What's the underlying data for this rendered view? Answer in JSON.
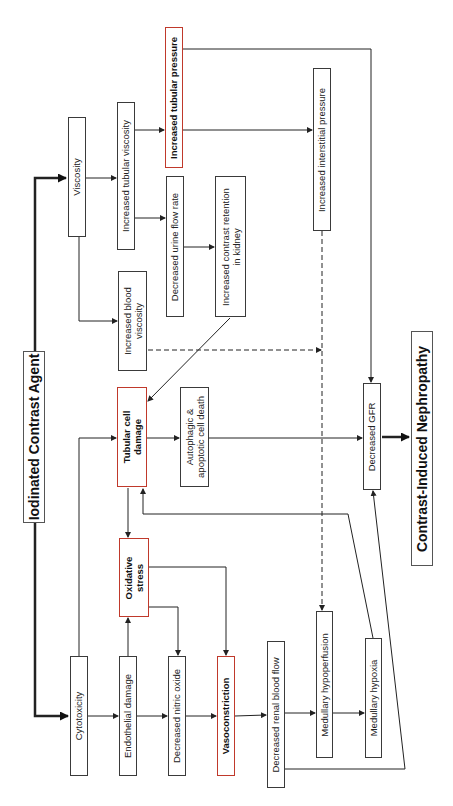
{
  "diagram": {
    "title": "Iodinated Contrast Agent",
    "outcome": "Contrast-Induced Nephropathy",
    "orientation": "rotated-90-ccw",
    "highlight_color": "#c0392b",
    "nodes": {
      "iodinated_contrast_agent": "Iodinated Contrast Agent",
      "viscosity": "Viscosity",
      "increased_tubular_viscosity": "Increased tubular viscosity",
      "increased_tubular_pressure": "Increased tubular pressure",
      "decreased_urine_flow_rate": "Decreased urine flow rate",
      "increased_contrast_retention_l1": "Increased contrast retention",
      "increased_contrast_retention_l2": "in kidney",
      "increased_interstitial_pressure": "Increased interstitial pressure",
      "increased_blood_viscosity_l1": "Increased blood",
      "increased_blood_viscosity_l2": "viscosity",
      "tubular_cell_damage_l1": "Tubular cell",
      "tubular_cell_damage_l2": "damage",
      "autophagic_l1": "Autophagic &",
      "autophagic_l2": "apoptotic cell death",
      "decreased_gfr": "Decreased GFR",
      "contrast_induced_nephropathy": "Contrast-Induced Nephropathy",
      "cytotoxicity": "Cytotoxicity",
      "endothelial_damage": "Endothelial damage",
      "oxidative_stress_l1": "Oxidative",
      "oxidative_stress_l2": "stress",
      "decreased_nitric_oxide": "Decreased nitric oxide",
      "vasoconstriction": "Vasoconstriction",
      "decreased_renal_blood_flow": "Decreased renal blood flow",
      "medullary_hypoperfusion": "Medullary hypoperfusion",
      "medullary_hypoxia": "Medullary hypoxia"
    },
    "edges": [
      {
        "from": "Iodinated Contrast Agent",
        "to": "Viscosity",
        "style": "thick"
      },
      {
        "from": "Iodinated Contrast Agent",
        "to": "Cytotoxicity",
        "style": "thick"
      },
      {
        "from": "Viscosity",
        "to": "Increased tubular viscosity"
      },
      {
        "from": "Viscosity",
        "to": "Increased blood viscosity"
      },
      {
        "from": "Increased tubular viscosity",
        "to": "Increased tubular pressure"
      },
      {
        "from": "Increased tubular viscosity",
        "to": "Decreased urine flow rate"
      },
      {
        "from": "Decreased urine flow rate",
        "to": "Increased contrast retention in kidney"
      },
      {
        "from": "Increased contrast retention in kidney",
        "to": "Tubular cell damage"
      },
      {
        "from": "Increased tubular pressure",
        "to": "Increased interstitial pressure"
      },
      {
        "from": "Increased tubular pressure",
        "to": "Decreased GFR"
      },
      {
        "from": "Increased interstitial pressure",
        "to": "Medullary hypoperfusion",
        "style": "dashed"
      },
      {
        "from": "Increased blood viscosity",
        "to": "Medullary hypoperfusion",
        "style": "dashed"
      },
      {
        "from": "Cytotoxicity",
        "to": "Tubular cell damage"
      },
      {
        "from": "Cytotoxicity",
        "to": "Endothelial damage"
      },
      {
        "from": "Endothelial damage",
        "to": "Oxidative stress"
      },
      {
        "from": "Endothelial damage",
        "to": "Decreased nitric oxide"
      },
      {
        "from": "Tubular cell damage",
        "to": "Oxidative stress"
      },
      {
        "from": "Tubular cell damage",
        "to": "Autophagic & apoptotic cell death"
      },
      {
        "from": "Oxidative stress",
        "to": "Decreased nitric oxide"
      },
      {
        "from": "Oxidative stress",
        "to": "Vasoconstriction"
      },
      {
        "from": "Decreased nitric oxide",
        "to": "Vasoconstriction"
      },
      {
        "from": "Vasoconstriction",
        "to": "Decreased renal blood flow"
      },
      {
        "from": "Decreased renal blood flow",
        "to": "Medullary hypoperfusion"
      },
      {
        "from": "Decreased renal blood flow",
        "to": "Decreased GFR"
      },
      {
        "from": "Medullary hypoperfusion",
        "to": "Medullary hypoxia"
      },
      {
        "from": "Medullary hypoxia",
        "to": "Tubular cell damage"
      },
      {
        "from": "Autophagic & apoptotic cell death",
        "to": "Decreased GFR"
      },
      {
        "from": "Decreased GFR",
        "to": "Contrast-Induced Nephropathy",
        "style": "thick"
      }
    ]
  }
}
